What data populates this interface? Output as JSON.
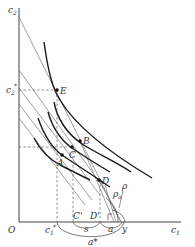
{
  "diagram": {
    "type": "economics-indifference-curve-diagram",
    "colors": {
      "axis": "#444444",
      "curve": "#1a1a1a",
      "budget_line": "#777777",
      "dashed": "#666666",
      "point": "#111111",
      "label": "#333333"
    },
    "axes": {
      "y_label": "c",
      "y_sub": "2",
      "x_label": "c",
      "x_sub": "1",
      "origin_label": "O"
    },
    "points": [
      {
        "id": "E",
        "label": "E"
      },
      {
        "id": "B",
        "label": "B"
      },
      {
        "id": "C",
        "label": "C"
      },
      {
        "id": "A",
        "label": "A"
      },
      {
        "id": "D",
        "label": "D"
      }
    ],
    "axis_marks": {
      "c2_star": {
        "base": "c",
        "sub": "2",
        "sup": "*"
      },
      "c1_star": {
        "base": "c",
        "sub": "1",
        "sup": "*"
      },
      "C_prime": "C'",
      "D_prime": "D'",
      "s": "s",
      "a": "a",
      "y": "y",
      "a_star": "a*"
    },
    "angle_labels": {
      "rho_a": {
        "base": "ρ",
        "sub": "a"
      },
      "rho": "ρ"
    }
  }
}
